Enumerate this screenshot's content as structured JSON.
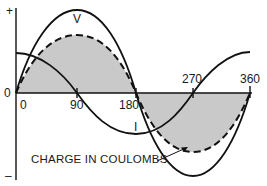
{
  "diagram": {
    "title": "",
    "y_axis": {
      "plus_label": "+",
      "minus_label": "–",
      "zero_label": "0"
    },
    "x_axis": {
      "ticks": [
        "0",
        "90",
        "180",
        "270",
        "360"
      ]
    },
    "curves": [
      {
        "name": "V",
        "label": "V",
        "style": "solid",
        "phase_deg": 0,
        "amplitude": 1.0
      },
      {
        "name": "I",
        "label": "I",
        "style": "solid",
        "phase_deg": 90,
        "amplitude": 0.48
      },
      {
        "name": "charge",
        "label": "CHARGE IN COULOMBS",
        "style": "dashed",
        "phase_deg": 0,
        "amplitude": 0.72,
        "fill": "#c8c8c8"
      }
    ],
    "annotation": "CHARGE IN COULOMBS",
    "colors": {
      "line": "#111111",
      "shade": "#c9c9c9",
      "background": "#ffffff"
    }
  }
}
